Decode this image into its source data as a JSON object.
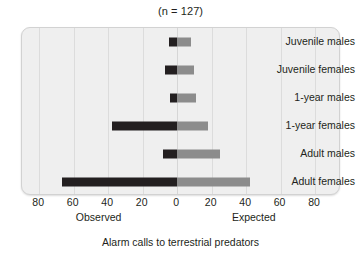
{
  "chart_data": {
    "type": "bar",
    "orientation": "horizontal",
    "title": "(n = 127)",
    "xlabel": "Alarm calls to terrestrial predators",
    "ylabel": "",
    "categories": [
      "Juvenile males",
      "Juvenile females",
      "1-year males",
      "1-year females",
      "Adult males",
      "Adult females"
    ],
    "series": [
      {
        "name": "Observed",
        "direction": "left",
        "color": "#231f20",
        "values": [
          5,
          7,
          4,
          38,
          8,
          67
        ]
      },
      {
        "name": "Expected",
        "direction": "right",
        "color": "#8c8c8c",
        "values": [
          8,
          10,
          11,
          18,
          25,
          42
        ]
      }
    ],
    "axis_tick_values": [
      80,
      60,
      40,
      20,
      0,
      20,
      40,
      60,
      80
    ],
    "axis_tick_labels": [
      "80",
      "60",
      "40",
      "20",
      "0",
      "20",
      "40",
      "60",
      "80"
    ],
    "axis_signed_ticks": [
      -80,
      -60,
      -40,
      -20,
      0,
      20,
      40,
      60,
      80
    ],
    "xlim": [
      -90,
      95
    ],
    "side_labels": {
      "left": "Observed",
      "right": "Expected"
    },
    "grid": true,
    "legend": "none",
    "plot_background": "#efefef"
  },
  "colors": {
    "observed": "#231f20",
    "expected": "#8c8c8c",
    "plot_background": "#efefef",
    "gridline": "#dcdcdc",
    "text": "#231f20"
  }
}
